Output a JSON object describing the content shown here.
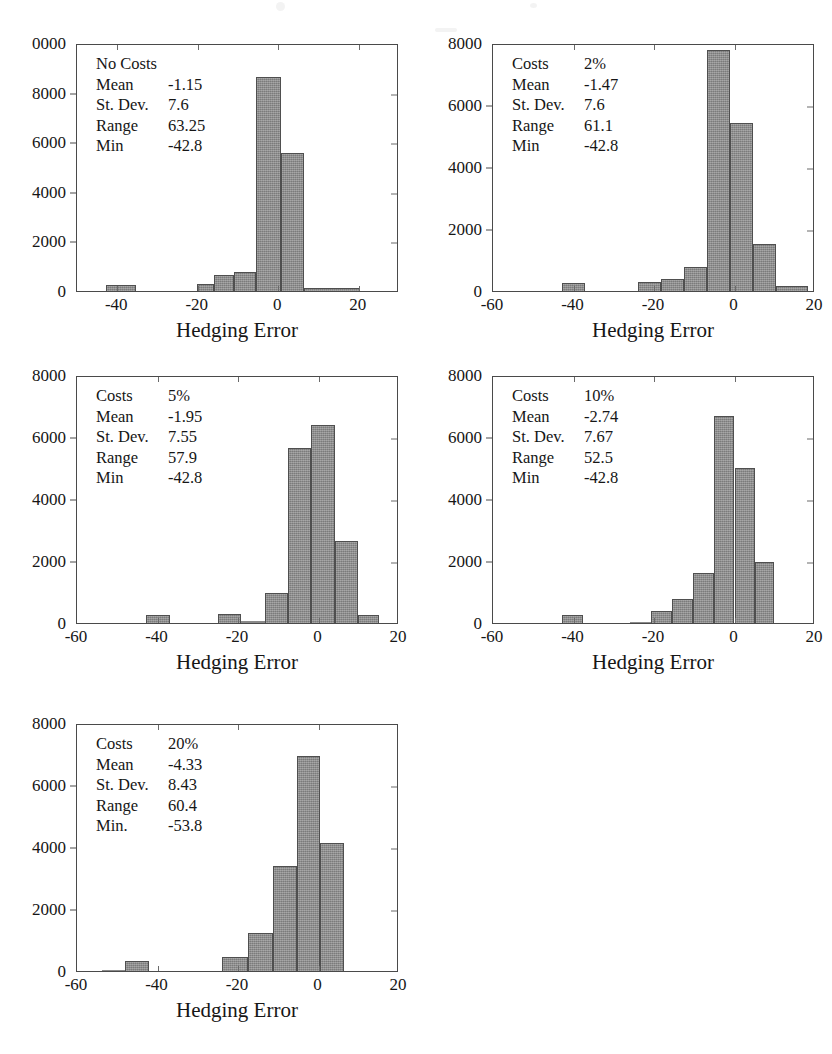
{
  "figure": {
    "x_axis_title": "Hedging Error",
    "bar_color": "#8a8a8a",
    "bar_edge_color": "#4f4f4f",
    "axis_color": "#4a4a4a",
    "background": "#ffffff"
  },
  "panels": [
    {
      "id": "panel-no-costs",
      "stats": {
        "title": "No Costs",
        "rows": [
          {
            "label": "Mean",
            "value": "-1.15"
          },
          {
            "label": "St. Dev.",
            "value": "7.6"
          },
          {
            "label": "Range",
            "value": "63.25"
          },
          {
            "label": "Min",
            "value": "-42.8"
          }
        ]
      },
      "chart_data": {
        "type": "bar",
        "title": "No Costs",
        "xlabel": "Hedging Error",
        "ylabel": "",
        "xlim": [
          -50,
          30
        ],
        "ylim": [
          0,
          10000
        ],
        "xticks": [
          -40,
          -20,
          0,
          20
        ],
        "xtick_labels": [
          "-40",
          "-20",
          "0",
          "20"
        ],
        "yticks": [
          0,
          2000,
          4000,
          6000,
          8000,
          10000
        ],
        "ytick_labels": [
          "0",
          "2000",
          "4000",
          "6000",
          "8000",
          "0000"
        ],
        "grid": false,
        "bin_width": 7.5,
        "bins": [
          {
            "left": -42.8,
            "right": -35.3,
            "value": 260
          },
          {
            "left": -35.3,
            "right": -27.8,
            "value": 0
          },
          {
            "left": -27.8,
            "right": -20.3,
            "value": 0
          },
          {
            "left": -20.3,
            "right": -16.0,
            "value": 270
          },
          {
            "left": -16.0,
            "right": -11.0,
            "value": 640
          },
          {
            "left": -11.0,
            "right": -5.5,
            "value": 760
          },
          {
            "left": -5.5,
            "right": 0.7,
            "value": 8620
          },
          {
            "left": 0.7,
            "right": 6.5,
            "value": 5570
          },
          {
            "left": 6.5,
            "right": 20.4,
            "value": 140
          }
        ]
      }
    },
    {
      "id": "panel-costs-2",
      "stats": {
        "title": null,
        "rows": [
          {
            "label": "Costs",
            "value": "2%"
          },
          {
            "label": "Mean",
            "value": "-1.47"
          },
          {
            "label": "St. Dev.",
            "value": "7.6"
          },
          {
            "label": "Range",
            "value": "61.1"
          },
          {
            "label": "Min",
            "value": "-42.8"
          }
        ]
      },
      "chart_data": {
        "type": "bar",
        "title": "Costs 2%",
        "xlabel": "Hedging Error",
        "ylabel": "",
        "xlim": [
          -60,
          20
        ],
        "ylim": [
          0,
          8000
        ],
        "xticks": [
          -60,
          -40,
          -20,
          0,
          20
        ],
        "xtick_labels": [
          "-60",
          "-40",
          "-20",
          "0",
          "20"
        ],
        "yticks": [
          0,
          2000,
          4000,
          6000,
          8000
        ],
        "ytick_labels": [
          "0",
          "2000",
          "4000",
          "6000",
          "8000"
        ],
        "grid": false,
        "bin_width": 5.7,
        "bins": [
          {
            "left": -42.8,
            "right": -37.1,
            "value": 250
          },
          {
            "left": -37.1,
            "right": -24.0,
            "value": 0
          },
          {
            "left": -24.0,
            "right": -18.3,
            "value": 290
          },
          {
            "left": -18.3,
            "right": -12.6,
            "value": 380
          },
          {
            "left": -12.6,
            "right": -6.9,
            "value": 780
          },
          {
            "left": -6.9,
            "right": -1.2,
            "value": 7760
          },
          {
            "left": -1.2,
            "right": 4.5,
            "value": 5420
          },
          {
            "left": 4.5,
            "right": 10.2,
            "value": 1530
          },
          {
            "left": 10.2,
            "right": 18.3,
            "value": 150
          }
        ]
      }
    },
    {
      "id": "panel-costs-5",
      "stats": {
        "title": null,
        "rows": [
          {
            "label": "Costs",
            "value": "5%"
          },
          {
            "label": "Mean",
            "value": "-1.95"
          },
          {
            "label": "St. Dev.",
            "value": "7.55"
          },
          {
            "label": "Range",
            "value": "57.9"
          },
          {
            "label": "Min",
            "value": "-42.8"
          }
        ]
      },
      "chart_data": {
        "type": "bar",
        "title": "Costs 5%",
        "xlabel": "Hedging Error",
        "ylabel": "",
        "xlim": [
          -60,
          20
        ],
        "ylim": [
          0,
          8000
        ],
        "xticks": [
          -60,
          -40,
          -20,
          0,
          20
        ],
        "xtick_labels": [
          "-60",
          "-40",
          "-20",
          "0",
          "20"
        ],
        "yticks": [
          0,
          2000,
          4000,
          6000,
          8000
        ],
        "ytick_labels": [
          "0",
          "2000",
          "4000",
          "6000",
          "8000"
        ],
        "grid": false,
        "bin_width": 5.8,
        "bins": [
          {
            "left": -42.8,
            "right": -37.0,
            "value": 270
          },
          {
            "left": -37.0,
            "right": -25.0,
            "value": 0
          },
          {
            "left": -25.0,
            "right": -19.2,
            "value": 280
          },
          {
            "left": -19.2,
            "right": -13.4,
            "value": 60
          },
          {
            "left": -13.4,
            "right": -7.6,
            "value": 980
          },
          {
            "left": -7.6,
            "right": -1.8,
            "value": 5660
          },
          {
            "left": -1.8,
            "right": 4.0,
            "value": 6400
          },
          {
            "left": 4.0,
            "right": 9.8,
            "value": 2640
          },
          {
            "left": 9.8,
            "right": 15.1,
            "value": 250
          }
        ]
      }
    },
    {
      "id": "panel-costs-10",
      "stats": {
        "title": null,
        "rows": [
          {
            "label": "Costs",
            "value": "10%"
          },
          {
            "label": "Mean",
            "value": "-2.74"
          },
          {
            "label": "St. Dev.",
            "value": "7.67"
          },
          {
            "label": "Range",
            "value": "52.5"
          },
          {
            "label": "Min",
            "value": "-42.8"
          }
        ]
      },
      "chart_data": {
        "type": "bar",
        "title": "Costs 10%",
        "xlabel": "Hedging Error",
        "ylabel": "",
        "xlim": [
          -60,
          20
        ],
        "ylim": [
          0,
          8000
        ],
        "xticks": [
          -60,
          -40,
          -20,
          0,
          20
        ],
        "xtick_labels": [
          "-60",
          "-40",
          "-20",
          "0",
          "20"
        ],
        "yticks": [
          0,
          2000,
          4000,
          6000,
          8000
        ],
        "ytick_labels": [
          "0",
          "2000",
          "4000",
          "6000",
          "8000"
        ],
        "grid": false,
        "bin_width": 5.2,
        "bins": [
          {
            "left": -42.8,
            "right": -37.6,
            "value": 270
          },
          {
            "left": -37.6,
            "right": -26.0,
            "value": 0
          },
          {
            "left": -26.0,
            "right": -20.8,
            "value": 40
          },
          {
            "left": -20.8,
            "right": -15.6,
            "value": 390
          },
          {
            "left": -15.6,
            "right": -10.4,
            "value": 780
          },
          {
            "left": -10.4,
            "right": -5.2,
            "value": 1610
          },
          {
            "left": -5.2,
            "right": 0.0,
            "value": 6670
          },
          {
            "left": 0.0,
            "right": 5.2,
            "value": 4990
          },
          {
            "left": 5.2,
            "right": 9.7,
            "value": 1960
          }
        ]
      }
    },
    {
      "id": "panel-costs-20",
      "stats": {
        "title": null,
        "rows": [
          {
            "label": "Costs",
            "value": "20%"
          },
          {
            "label": "Mean",
            "value": "-4.33"
          },
          {
            "label": "St. Dev.",
            "value": "8.43"
          },
          {
            "label": "Range",
            "value": "60.4"
          },
          {
            "label": "Min.",
            "value": "-53.8"
          }
        ]
      },
      "chart_data": {
        "type": "bar",
        "title": "Costs 20%",
        "xlabel": "Hedging Error",
        "ylabel": "",
        "xlim": [
          -60,
          20
        ],
        "ylim": [
          0,
          8000
        ],
        "xticks": [
          -60,
          -40,
          -20,
          0,
          20
        ],
        "xtick_labels": [
          "-60",
          "-40",
          "-20",
          "0",
          "20"
        ],
        "yticks": [
          0,
          2000,
          4000,
          6000,
          8000
        ],
        "ytick_labels": [
          "0",
          "2000",
          "4000",
          "6000",
          "8000"
        ],
        "grid": false,
        "bin_width": 5.8,
        "bins": [
          {
            "left": -53.8,
            "right": -48.0,
            "value": 40
          },
          {
            "left": -48.0,
            "right": -42.2,
            "value": 310
          },
          {
            "left": -42.2,
            "right": -24.0,
            "value": 0
          },
          {
            "left": -24.0,
            "right": -17.5,
            "value": 460
          },
          {
            "left": -17.5,
            "right": -11.3,
            "value": 1230
          },
          {
            "left": -11.3,
            "right": -5.4,
            "value": 3380
          },
          {
            "left": -5.4,
            "right": 0.4,
            "value": 6920
          },
          {
            "left": 0.4,
            "right": 6.4,
            "value": 4120
          }
        ]
      }
    }
  ]
}
